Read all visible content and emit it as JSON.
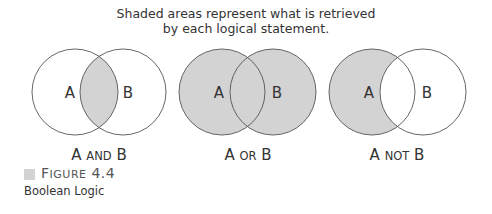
{
  "caption": {
    "line1": "Shaded areas represent what is retrieved",
    "line2": "by each logical statement."
  },
  "diagrams": [
    {
      "operation": "A AND B",
      "label_parts": [
        "A ",
        "AND",
        " B"
      ],
      "set_a": "A",
      "set_b": "B",
      "shaded_region": "intersection"
    },
    {
      "operation": "A OR B",
      "label_parts": [
        "A ",
        "OR",
        " B"
      ],
      "set_a": "A",
      "set_b": "B",
      "shaded_region": "union"
    },
    {
      "operation": "A NOT B",
      "label_parts": [
        "A ",
        "NOT",
        " B"
      ],
      "set_a": "A",
      "set_b": "B",
      "shaded_region": "a_minus_b"
    }
  ],
  "figure": {
    "number_prefix_first": "F",
    "number_prefix_rest": "IGURE",
    "number": " 4.4",
    "title": "Boolean Logic"
  },
  "colors": {
    "shade": "#d3d3d3",
    "stroke": "#555555",
    "text": "#333333"
  }
}
